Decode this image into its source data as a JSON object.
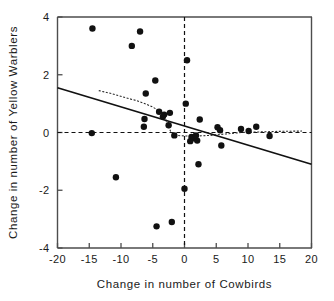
{
  "chart_data": {
    "type": "scatter",
    "title": "",
    "xlabel": "Change in number of Cowbirds",
    "ylabel": "Change in number of Yellow Warblers",
    "xlim": [
      -20,
      20
    ],
    "ylim": [
      -4,
      4
    ],
    "xticks": [
      -20,
      -15,
      -10,
      -5,
      0,
      5,
      10,
      15,
      20
    ],
    "xticklabels": [
      "-20",
      "-15",
      "-10",
      "-5",
      "0",
      "5",
      "10",
      "15",
      "20"
    ],
    "yticks": [
      -4,
      -2,
      0,
      2,
      4
    ],
    "yticklabels": [
      "-4",
      "-2",
      "0",
      "2",
      "4"
    ],
    "grid": false,
    "legend": null,
    "points": [
      [
        -14.5,
        3.6
      ],
      [
        -7.0,
        3.5
      ],
      [
        -8.3,
        3.0
      ],
      [
        0.4,
        2.5
      ],
      [
        -4.6,
        1.8
      ],
      [
        -6.1,
        1.35
      ],
      [
        0.2,
        1.0
      ],
      [
        -4.0,
        0.72
      ],
      [
        -2.3,
        0.68
      ],
      [
        -3.2,
        0.62
      ],
      [
        -3.4,
        0.55
      ],
      [
        -6.3,
        0.47
      ],
      [
        2.4,
        0.45
      ],
      [
        -6.4,
        0.2
      ],
      [
        -2.5,
        0.25
      ],
      [
        5.2,
        0.18
      ],
      [
        8.9,
        0.12
      ],
      [
        11.3,
        0.2
      ],
      [
        10.1,
        0.05
      ],
      [
        5.6,
        0.08
      ],
      [
        -14.6,
        -0.02
      ],
      [
        13.4,
        -0.12
      ],
      [
        1.5,
        -0.2
      ],
      [
        1.1,
        -0.15
      ],
      [
        2.0,
        -0.28
      ],
      [
        1.8,
        -0.1
      ],
      [
        -1.6,
        -0.1
      ],
      [
        0.9,
        -0.3
      ],
      [
        5.8,
        -0.45
      ],
      [
        2.2,
        -1.1
      ],
      [
        -10.8,
        -1.55
      ],
      [
        0.0,
        -1.95
      ],
      [
        -2.0,
        -3.1
      ],
      [
        -4.4,
        -3.25
      ]
    ],
    "regression_line": {
      "label": "least-squares fit",
      "x": [
        -20,
        20
      ],
      "y": [
        1.55,
        -1.1
      ]
    },
    "smooth_line": {
      "label": "lowess smoother",
      "x": [
        -13.5,
        -11.5,
        -9.5,
        -7.5,
        -6.0,
        -5.0,
        -4.2,
        -3.6,
        -3.2,
        -2.8,
        -2.2,
        -1.4,
        0.0,
        2.0,
        4.0,
        6.5,
        9.0,
        12.0,
        15.0,
        18.5
      ],
      "y": [
        1.45,
        1.35,
        1.22,
        1.1,
        0.98,
        0.88,
        0.78,
        0.7,
        0.62,
        0.35,
        0.05,
        -0.1,
        -0.12,
        -0.12,
        -0.1,
        -0.05,
        0.0,
        0.02,
        0.04,
        0.05
      ]
    },
    "reference_lines": [
      {
        "orientation": "vertical",
        "value": 0,
        "style": "dashed"
      },
      {
        "orientation": "horizontal",
        "value": 0,
        "style": "dashed"
      }
    ]
  }
}
